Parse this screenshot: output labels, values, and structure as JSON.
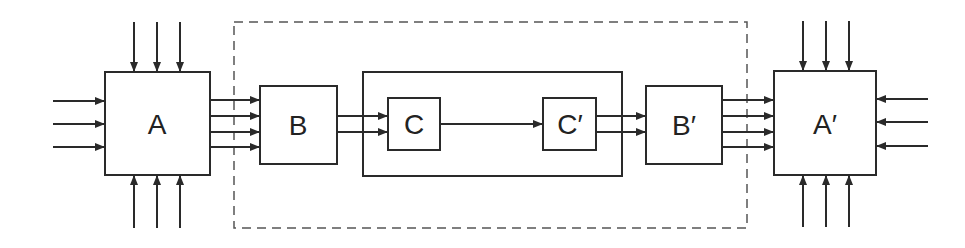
{
  "diagram": {
    "nodes": {
      "A": {
        "label": "A"
      },
      "B": {
        "label": "B"
      },
      "C": {
        "label": "C"
      },
      "C_prime": {
        "label": "C′"
      },
      "B_prime": {
        "label": "B′"
      },
      "A_prime": {
        "label": "A′"
      }
    },
    "groups": [
      {
        "id": "dashed-boundary",
        "style": "dashed",
        "contains": [
          "B",
          "C",
          "C_prime",
          "B_prime"
        ]
      },
      {
        "id": "inner-solid",
        "style": "solid",
        "contains": [
          "C",
          "C_prime"
        ]
      }
    ],
    "edges": [
      {
        "from": "external-top",
        "to": "A",
        "count": 3
      },
      {
        "from": "external-left",
        "to": "A",
        "count": 3
      },
      {
        "from": "external-bottom",
        "to": "A",
        "count": 3
      },
      {
        "from": "A",
        "to": "B",
        "count": 4
      },
      {
        "from": "B",
        "to": "C",
        "count": 2
      },
      {
        "from": "C",
        "to": "C_prime",
        "count": 1
      },
      {
        "from": "C_prime",
        "to": "B_prime",
        "count": 2
      },
      {
        "from": "B_prime",
        "to": "A_prime",
        "count": 4
      },
      {
        "from": "external-top",
        "to": "A_prime",
        "count": 3
      },
      {
        "from": "external-right",
        "to": "A_prime",
        "count": 3
      },
      {
        "from": "external-bottom",
        "to": "A_prime",
        "count": 3
      }
    ],
    "colors": {
      "stroke": "#2a2a2a",
      "background": "#ffffff"
    }
  }
}
